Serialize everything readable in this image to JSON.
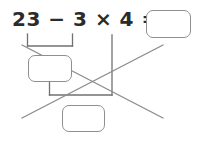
{
  "worksheet": {
    "title": "order-of-operations-worksheet",
    "expression": "23 − 3 × 4 =",
    "operands": [
      "23",
      "3",
      "4"
    ],
    "operators": [
      "−",
      "×",
      "="
    ],
    "result_value": "",
    "result_placeholder": "",
    "step1_value": "",
    "step1_placeholder": "",
    "step2_value": "",
    "step2_placeholder": "",
    "colors": {
      "text": "#2b2b2b",
      "box_stroke": "#8d8f92",
      "bracket_stroke": "#6e7073",
      "cross_stroke": "#8a8c8f",
      "background": "#ffffff"
    },
    "annotations": {
      "bracket_top_label": "groups 23 − 3",
      "bracket_bottom_label": "groups step1 and 4",
      "cross_out_label": "crossed-out diagonal lines"
    }
  }
}
